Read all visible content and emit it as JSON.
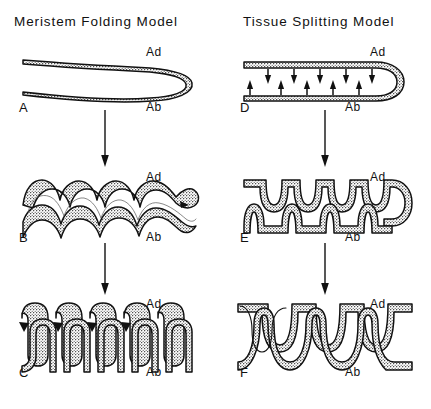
{
  "figure": {
    "background_color": "#ffffff",
    "ink_color": "#111111",
    "columns": [
      {
        "id": "left",
        "title": "Meristem Folding Model",
        "panels": [
          {
            "letter": "A",
            "adaxial_label": "Ad",
            "abaxial_label": "Ab",
            "stage": "unfolded primordium, smooth double layer folded at distal tip"
          },
          {
            "letter": "B",
            "adaxial_label": "Ad",
            "abaxial_label": "Ab",
            "stage": "sinusoidal undulation of entire meristem, 4 waves"
          },
          {
            "letter": "C",
            "adaxial_label": "Ad",
            "abaxial_label": "Ab",
            "stage": "deep square-wave folding, 6 interdigitating teeth"
          }
        ]
      },
      {
        "id": "right",
        "title": "Tissue Splitting Model",
        "panels": [
          {
            "letter": "D",
            "adaxial_label": "Ad",
            "abaxial_label": "Ab",
            "stage": "flat double layer with inward force arrows at split sites",
            "force_arrows": {
              "adaxial_count": 5,
              "abaxial_count": 5,
              "adaxial_direction": "down",
              "abaxial_direction": "up"
            }
          },
          {
            "letter": "E",
            "adaxial_label": "Ad",
            "abaxial_label": "Ab",
            "stage": "narrow splits initiated, 4 notches per surface, offset"
          },
          {
            "letter": "F",
            "adaxial_label": "Ad",
            "abaxial_label": "Ab",
            "stage": "splits deepened into alternating lobes, 5 teeth"
          }
        ]
      }
    ],
    "flow_arrows": [
      {
        "column": "left",
        "from_panel": "A",
        "to_panel": "B",
        "direction": "down"
      },
      {
        "column": "left",
        "from_panel": "B",
        "to_panel": "C",
        "direction": "down"
      },
      {
        "column": "right",
        "from_panel": "D",
        "to_panel": "E",
        "direction": "down"
      },
      {
        "column": "right",
        "from_panel": "E",
        "to_panel": "F",
        "direction": "down"
      }
    ]
  }
}
